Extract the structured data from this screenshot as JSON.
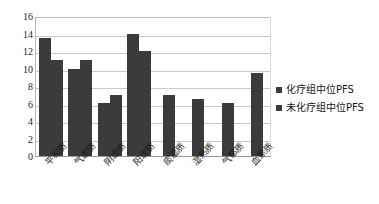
{
  "chart_data": {
    "type": "bar",
    "title": "",
    "subtitle": "",
    "xlabel": "",
    "ylabel": "",
    "ylim": [
      0,
      16
    ],
    "ytick_step": 2,
    "yticks": [
      16,
      14,
      12,
      10,
      8,
      6,
      4,
      2,
      0
    ],
    "grid": true,
    "grid_axis": "y",
    "legend_position": "right",
    "bar_color": "#3b3b3b",
    "categories": [
      "平和质",
      "气虚质",
      "阴虚质",
      "阳虚质",
      "痰湿质",
      "湿热质",
      "气郁质",
      "血瘀质"
    ],
    "series": [
      {
        "name": "化疗组中位PFS",
        "color": "#3b3b3b",
        "values": [
          13.5,
          10,
          6.1,
          14,
          7,
          6.5,
          6.1,
          9.5
        ]
      },
      {
        "name": "未化疗组中位PFS",
        "color": "#3b3b3b",
        "values": [
          11,
          11,
          7,
          12,
          null,
          null,
          null,
          null
        ]
      }
    ]
  },
  "legend": {
    "items": [
      {
        "label": "化疗组中位PFS",
        "color": "#3b3b3b",
        "marker": "square-marker"
      },
      {
        "label": "未化疗组中位PFS",
        "color": "#3b3b3b",
        "marker": "square-marker"
      }
    ]
  }
}
